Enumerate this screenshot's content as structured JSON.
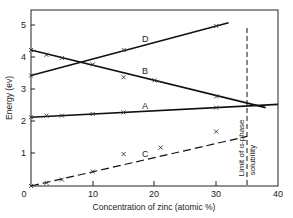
{
  "chart_data": {
    "type": "line",
    "title": "",
    "xlabel": "Concentration of zinc (atomic %)",
    "ylabel": "Energy (ev)",
    "xlim": [
      0,
      40
    ],
    "ylim": [
      0,
      5.5
    ],
    "xticks": [
      0,
      10,
      20,
      30,
      40
    ],
    "yticks": [
      1,
      2,
      3,
      4,
      5
    ],
    "xtick_labels": [
      "0",
      "10",
      "20",
      "30",
      "40"
    ],
    "ytick_labels": [
      "1",
      "2",
      "3",
      "4",
      "5"
    ],
    "grid": false,
    "legend": "none (series labelled inline)",
    "series": [
      {
        "name": "A",
        "style": "solid",
        "line": [
          [
            0,
            2.15
          ],
          [
            40,
            2.55
          ]
        ],
        "points": [
          [
            0,
            2.15
          ],
          [
            2.5,
            2.2
          ],
          [
            5,
            2.2
          ],
          [
            10,
            2.25
          ],
          [
            15,
            2.3
          ],
          [
            30,
            2.45
          ]
        ]
      },
      {
        "name": "B",
        "style": "solid",
        "line": [
          [
            0,
            4.25
          ],
          [
            38,
            2.45
          ]
        ],
        "points": [
          [
            0,
            4.25
          ],
          [
            2.5,
            4.1
          ],
          [
            5,
            4.0
          ],
          [
            10,
            3.8
          ],
          [
            15,
            3.4
          ],
          [
            20,
            3.3
          ],
          [
            30,
            2.8
          ]
        ]
      },
      {
        "name": "C",
        "style": "dashed",
        "line": [
          [
            0,
            0.0
          ],
          [
            35,
            1.55
          ]
        ],
        "points": [
          [
            0,
            0.0
          ],
          [
            2.5,
            0.1
          ],
          [
            5,
            0.2
          ],
          [
            10,
            0.45
          ],
          [
            15,
            1.0
          ],
          [
            21,
            1.2
          ],
          [
            30,
            1.7
          ]
        ]
      },
      {
        "name": "D",
        "style": "solid",
        "line": [
          [
            0,
            3.45
          ],
          [
            32,
            5.1
          ]
        ],
        "points": [
          [
            0,
            3.45
          ],
          [
            15,
            4.25
          ],
          [
            30,
            5.0
          ]
        ]
      }
    ],
    "annotations": [
      {
        "type": "vline",
        "x": 35,
        "style": "dashed",
        "text": "Limit of α-phase solubility"
      }
    ]
  },
  "labels": {
    "xlabel": "Concentration of zinc (atomic %)",
    "ylabel": "Energy (ev)",
    "annotation_line1": "Limit of α-phase",
    "annotation_line2": "solubility",
    "series_A": "A",
    "series_B": "B",
    "series_C": "C",
    "series_D": "D",
    "x0": "0",
    "x10": "10",
    "x20": "20",
    "x30": "30",
    "x40": "40",
    "y1": "1",
    "y2": "2",
    "y3": "3",
    "y4": "4",
    "y5": "5"
  }
}
